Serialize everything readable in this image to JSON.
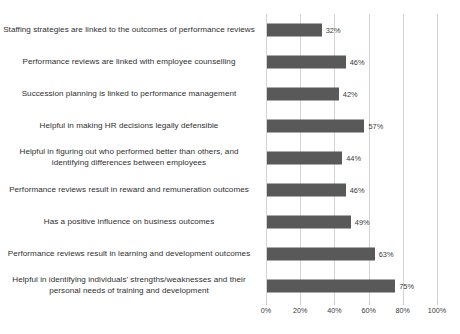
{
  "chart_data": {
    "type": "bar",
    "orientation": "horizontal",
    "title": "",
    "xlabel": "",
    "ylabel": "",
    "xlim": [
      0,
      100
    ],
    "grid": true,
    "legend": false,
    "value_suffix": "%",
    "categories": [
      "Staffing strategies are linked to the outcomes of performance reviews",
      "Performance reviews are linked with employee counselling",
      "Succession planning is linked to performance management",
      "Helpful in making HR decisions legally defensible",
      "Helpful in figuring out who performed better than others, and identifying differences between employees",
      "Performance reviews result in reward and remuneration outcomes",
      "Has a positive influence on business outcomes",
      "Performance reviews result in learning and development outcomes",
      "Helpful in identifying individuals' strengths/weaknesses and their personal needs of training and development"
    ],
    "values": [
      32,
      46,
      42,
      57,
      44,
      46,
      49,
      63,
      75
    ],
    "value_labels": [
      "32%",
      "46%",
      "42%",
      "57%",
      "44%",
      "46%",
      "49%",
      "63%",
      "75%"
    ],
    "xticks": [
      0,
      20,
      40,
      60,
      80,
      100
    ],
    "xtick_labels": [
      "0%",
      "20%",
      "40%",
      "60%",
      "80%",
      "100%"
    ],
    "bar_color": "#595959",
    "gridline_color": "#d3d3d3",
    "text_color": "#2f2f2f"
  },
  "caption": {
    "cut_off_text": "partially visible caption line cut off at bottom edge"
  }
}
